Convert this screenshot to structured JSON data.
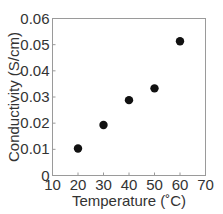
{
  "chart_data": {
    "type": "scatter",
    "title": "",
    "xlabel": "Temperature (˚C)",
    "ylabel": "Conductivity (S/cm)",
    "xlim": [
      10,
      70
    ],
    "ylim": [
      0,
      0.06
    ],
    "x_ticks": [
      10,
      20,
      30,
      40,
      50,
      60,
      70
    ],
    "x_tick_labels": [
      "10",
      "20",
      "30",
      "40",
      "50",
      "60",
      "70"
    ],
    "y_ticks": [
      0,
      0.01,
      0.02,
      0.03,
      0.04,
      0.05,
      0.06
    ],
    "y_tick_labels": [
      "0",
      "0.01",
      "0.02",
      "0.03",
      "0.04",
      "0.05",
      "0.06"
    ],
    "grid": false,
    "legend": null,
    "series": [
      {
        "name": "Conductivity",
        "marker": "filled-circle",
        "color": "#111111",
        "x": [
          20,
          30,
          40,
          50,
          60
        ],
        "y": [
          0.0103,
          0.0193,
          0.0288,
          0.0333,
          0.0513
        ]
      }
    ]
  }
}
